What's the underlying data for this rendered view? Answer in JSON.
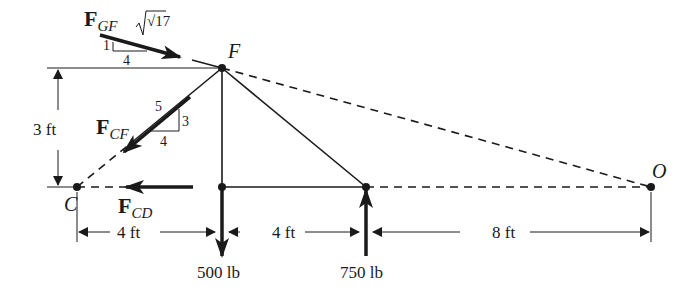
{
  "diagram": {
    "type": "truss-free-body-diagram",
    "points": {
      "F": {
        "label": "F"
      },
      "C": {
        "label": "C"
      },
      "O": {
        "label": "O"
      }
    },
    "forces": {
      "FGF": {
        "symbol": "F",
        "subscript": "GF",
        "slope": {
          "hyp": "√17",
          "rise": "1",
          "run": "4"
        }
      },
      "FCF": {
        "symbol": "F",
        "subscript": "CF",
        "slope": {
          "hyp": "5",
          "rise": "3",
          "run": "4"
        }
      },
      "FCD": {
        "symbol": "F",
        "subscript": "CD"
      }
    },
    "loads": [
      {
        "value": "500 lb",
        "direction": "down"
      },
      {
        "value": "750 lb",
        "direction": "up"
      }
    ],
    "dimensions": {
      "height": "3 ft",
      "spans": [
        "4 ft",
        "4 ft",
        "8 ft"
      ]
    },
    "colors": {
      "ink": "#1a1a1a",
      "background": "#ffffff"
    }
  }
}
